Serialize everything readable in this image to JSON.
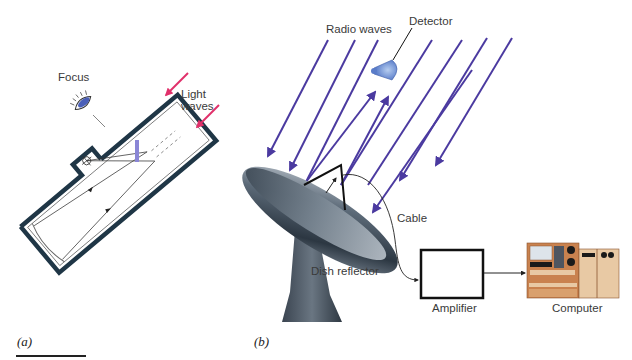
{
  "figure": {
    "panel_a": {
      "label": "(a)",
      "title": "Optical reflecting telescope",
      "labels": {
        "focus": "Focus",
        "light_waves_line1": "Light",
        "light_waves_line2": "waves"
      },
      "colors": {
        "tube": "#1f3646",
        "light_arrows": "#e0306a",
        "secondary_mirror": "#8a86d6",
        "eyepiece": "#4a5fb8"
      }
    },
    "panel_b": {
      "label": "(b)",
      "title": "Radio telescope",
      "labels": {
        "radio_waves": "Radio waves",
        "detector": "Detector",
        "cable": "Cable",
        "dish_reflector": "Dish reflector",
        "amplifier": "Amplifier",
        "computer": "Computer"
      },
      "colors": {
        "radio_waves": "#4b3aa0",
        "detector": "#6f94d8",
        "dish": "#4a5866",
        "computer_body": "#c9824f",
        "computer_panel": "#e8c9a4"
      }
    }
  }
}
